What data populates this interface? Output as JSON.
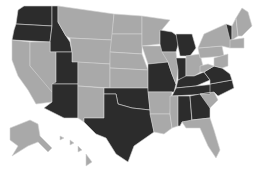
{
  "map": {
    "title": "United States map",
    "colors": {
      "highlighted": "#2c2c2c",
      "default": "#a9a9a9",
      "background": "#ffffff",
      "border": "#d4d4d4"
    },
    "highlighted_states": [
      "WA",
      "OR",
      "ID",
      "UT",
      "AZ",
      "OK",
      "TX",
      "MO",
      "WI",
      "MI",
      "IN",
      "KY",
      "TN",
      "NC",
      "VA",
      "GA",
      "AL",
      "VT"
    ],
    "states": [
      {
        "id": "WA",
        "hl": true,
        "d": "M24,6 L52,6 L52,26 L16,24 L18,10 Z"
      },
      {
        "id": "OR",
        "hl": true,
        "d": "M16,24 L52,26 L50,42 L12,40 L14,30 Z"
      },
      {
        "id": "ID",
        "hl": true,
        "d": "M52,6 L58,6 L58,22 L66,36 L70,42 L72,52 L50,52 L50,42 L52,26 Z"
      },
      {
        "id": "MT",
        "hl": false,
        "d": "M58,6 L114,14 L112,40 L70,38 L66,36 L58,22 Z"
      },
      {
        "id": "WY",
        "hl": false,
        "d": "M70,38 L112,40 L110,64 L72,62 L72,52 Z"
      },
      {
        "id": "CA",
        "hl": false,
        "d": "M12,40 L30,42 L30,66 L54,92 L52,102 L36,104 L28,90 L18,76 L12,60 Z"
      },
      {
        "id": "NV",
        "hl": false,
        "d": "M30,42 L50,42 L50,52 L56,52 L56,84 L52,92 L30,66 Z"
      },
      {
        "id": "UT",
        "hl": true,
        "d": "M56,52 L72,52 L72,62 L78,62 L78,84 L52,84 L56,82 Z"
      },
      {
        "id": "AZ",
        "hl": true,
        "d": "M52,84 L78,84 L78,118 L64,118 L44,108 L52,102 L52,92 Z"
      },
      {
        "id": "CO",
        "hl": false,
        "d": "M78,62 L110,64 L110,88 L78,86 Z"
      },
      {
        "id": "NM",
        "hl": false,
        "d": "M78,86 L104,88 L104,118 L84,118 L84,122 L78,118 Z"
      },
      {
        "id": "ND",
        "hl": false,
        "d": "M114,14 L142,16 L142,34 L112,34 Z"
      },
      {
        "id": "SD",
        "hl": false,
        "d": "M112,34 L142,34 L142,54 L110,52 Z"
      },
      {
        "id": "NE",
        "hl": false,
        "d": "M110,52 L142,54 L148,70 L110,68 Z"
      },
      {
        "id": "KS",
        "hl": false,
        "d": "M110,68 L148,70 L148,88 L110,88 Z"
      },
      {
        "id": "OK",
        "hl": true,
        "d": "M104,88 L148,88 L150,110 L132,108 L118,104 L116,94 L104,94 Z"
      },
      {
        "id": "TX",
        "hl": true,
        "d": "M104,94 L116,94 L118,104 L132,108 L150,110 L154,132 L134,146 L128,162 L116,154 L106,138 L96,134 L84,122 L84,118 L104,118 Z"
      },
      {
        "id": "MN",
        "hl": false,
        "d": "M142,16 L170,20 L160,32 L160,44 L142,46 Z"
      },
      {
        "id": "IA",
        "hl": false,
        "d": "M142,46 L162,46 L168,62 L148,64 Z"
      },
      {
        "id": "MO",
        "hl": true,
        "d": "M148,64 L168,62 L172,74 L176,84 L174,92 L148,92 L148,70 Z"
      },
      {
        "id": "AR",
        "hl": false,
        "d": "M148,92 L172,92 L170,114 L150,114 L150,110 Z"
      },
      {
        "id": "LA",
        "hl": false,
        "d": "M150,114 L170,114 L172,128 L164,134 L154,132 Z"
      },
      {
        "id": "WI",
        "hl": true,
        "d": "M160,30 L172,32 L180,38 L176,52 L162,52 L160,44 Z"
      },
      {
        "id": "MI",
        "hl": true,
        "d": "M176,34 L192,34 L196,48 L190,56 L180,56 L178,46 Z"
      },
      {
        "id": "IL",
        "hl": false,
        "d": "M162,52 L176,52 L178,70 L176,84 L172,74 L168,62 Z"
      },
      {
        "id": "IN",
        "hl": true,
        "d": "M176,58 L186,58 L186,78 L178,80 L178,70 Z"
      },
      {
        "id": "OH",
        "hl": false,
        "d": "M186,56 L200,54 L204,70 L194,76 L186,76 Z"
      },
      {
        "id": "KY",
        "hl": true,
        "d": "M178,80 L186,76 L194,76 L204,72 L210,80 L196,86 L176,88 Z"
      },
      {
        "id": "TN",
        "hl": true,
        "d": "M174,92 L176,88 L196,86 L216,84 L210,94 L172,96 Z"
      },
      {
        "id": "MS",
        "hl": false,
        "d": "M170,96 L178,96 L178,126 L172,128 L170,114 Z"
      },
      {
        "id": "AL",
        "hl": true,
        "d": "M178,96 L190,96 L192,122 L182,122 L180,126 L178,126 Z"
      },
      {
        "id": "GA",
        "hl": true,
        "d": "M190,96 L200,94 L210,104 L210,118 L192,120 Z"
      },
      {
        "id": "FL",
        "hl": false,
        "d": "M182,122 L192,120 L210,118 L214,130 L220,150 L216,158 L208,146 L200,128 L186,128 Z"
      },
      {
        "id": "SC",
        "hl": false,
        "d": "M200,94 L214,92 L218,100 L210,108 Z"
      },
      {
        "id": "NC",
        "hl": true,
        "d": "M210,84 L232,80 L234,88 L218,96 L214,92 L200,94 L210,94 Z"
      },
      {
        "id": "VA",
        "hl": true,
        "d": "M204,72 L214,66 L222,68 L230,74 L232,80 L210,84 L210,80 Z"
      },
      {
        "id": "WV",
        "hl": false,
        "d": "M200,66 L208,64 L214,66 L204,72 L200,72 Z"
      },
      {
        "id": "PA",
        "hl": false,
        "d": "M198,48 L222,46 L224,56 L200,58 Z"
      },
      {
        "id": "NY",
        "hl": false,
        "d": "M204,34 L226,24 L232,38 L230,48 L222,46 L198,48 Z"
      },
      {
        "id": "VT",
        "hl": true,
        "d": "M226,24 L232,26 L232,40 L230,40 Z"
      },
      {
        "id": "NH",
        "hl": false,
        "d": "M232,26 L236,18 L238,36 L232,40 Z"
      },
      {
        "id": "ME",
        "hl": false,
        "d": "M236,18 L242,8 L248,12 L252,26 L242,36 L238,36 Z"
      },
      {
        "id": "MA_CT_RI",
        "hl": false,
        "d": "M230,40 L244,38 L244,48 L230,48 Z"
      },
      {
        "id": "NJ_DE_MD",
        "hl": false,
        "d": "M214,58 L228,54 L228,66 L222,68 L214,66 Z"
      },
      {
        "id": "AK",
        "hl": false,
        "d": "M10,128 L30,120 L38,124 L40,136 L52,148 L48,152 L38,142 L28,146 L12,156 L18,146 L10,140 Z"
      },
      {
        "id": "HI",
        "hl": false,
        "d": "M60,136 L64,138 L60,140 Z M70,140 L74,143 L70,145 Z M78,146 L82,150 L78,152 Z M86,154 L92,162 L86,166 Z"
      }
    ]
  }
}
